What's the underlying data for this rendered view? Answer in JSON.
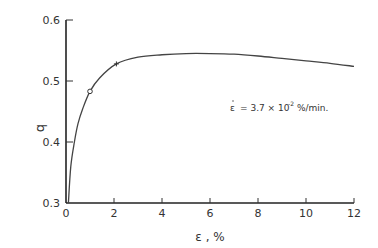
{
  "chart_data": {
    "type": "line",
    "title": "",
    "xlabel": "ε, %",
    "ylabel": "q",
    "xlim": [
      0,
      12
    ],
    "ylim": [
      0.3,
      0.6
    ],
    "x_ticks": [
      0,
      2,
      4,
      6,
      8,
      10,
      12
    ],
    "y_ticks": [
      0.3,
      0.4,
      0.5,
      0.6
    ],
    "x_tick_labels": [
      "0",
      "2",
      "4",
      "6",
      "8",
      "10",
      "12"
    ],
    "y_tick_labels": [
      "0.3",
      "0.4",
      "0.5",
      "0.6"
    ],
    "grid": false,
    "annotation": "ε̇ = 3.7 × 10⁻² %/min.",
    "series": [
      {
        "name": "q vs ε",
        "x": [
          0.1,
          0.2,
          0.35,
          0.5,
          0.7,
          1.0,
          1.4,
          2.1,
          3.0,
          4.0,
          5.0,
          6.0,
          7.0,
          8.0,
          9.0,
          10.0,
          11.0,
          12.0
        ],
        "values": [
          0.3,
          0.36,
          0.4,
          0.43,
          0.455,
          0.483,
          0.505,
          0.528,
          0.539,
          0.543,
          0.545,
          0.545,
          0.544,
          0.541,
          0.537,
          0.533,
          0.529,
          0.524
        ]
      }
    ],
    "markers": [
      {
        "symbol": "circle",
        "x": 1.0,
        "y": 0.483
      },
      {
        "symbol": "plus",
        "x": 2.1,
        "y": 0.528
      }
    ]
  },
  "labels": {
    "ylabel": "q",
    "xlabel": "ε , %",
    "annotation_lhs": "ε",
    "annotation_rhs": "= 3.7 × 10",
    "annotation_exp": "-2",
    "annotation_unit": "%/min."
  }
}
